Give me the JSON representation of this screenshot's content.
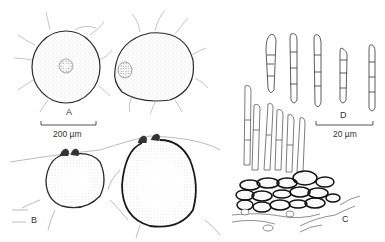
{
  "figure": {
    "panels": [
      {
        "id": "A",
        "label": "A",
        "description": "Two ascomata viewed from above, ostiolar region visible"
      },
      {
        "id": "B",
        "label": "B",
        "description": "Two ascomata in vertical section, immersed in substrate with beaked ostioles"
      },
      {
        "id": "C",
        "label": "C",
        "description": "Basal stromatic tissue with hyphae and conidiophores"
      },
      {
        "id": "D",
        "label": "D",
        "description": "Five septate, cylindrical to fusiform conidia/ascospores"
      }
    ],
    "scale_bars": [
      {
        "panel": "A",
        "label": "200 µm"
      },
      {
        "panel": "D",
        "label": "20 µm"
      }
    ]
  },
  "colors": {
    "ink": "#2a2a2a",
    "paper": "#ffffff"
  }
}
